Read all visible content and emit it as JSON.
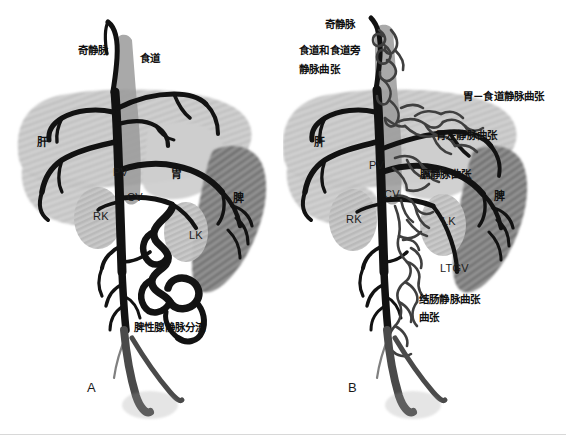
{
  "figure": {
    "title": "",
    "width": 566,
    "height": 435,
    "background": "#ffffff"
  },
  "colors": {
    "vessel_dark": "#111111",
    "vessel_mid": "#3a3a3a",
    "organ_light": "#c9c9c9",
    "organ_hatch_light": "#b4b4b4",
    "organ_dark": "#8a8a8a",
    "organ_hatch_dark": "#6d6d6d",
    "kidney": "#bdbdbd",
    "esophagus": "#9a9a9a",
    "text": "#101010",
    "rule": "#d8d8d8"
  },
  "panels": [
    {
      "id": "A",
      "letter": "A",
      "labels": [
        {
          "name": "azygos-vein",
          "text": "奇静脉",
          "x": 78,
          "y": 44,
          "style": "cn"
        },
        {
          "name": "esophagus",
          "text": "食道",
          "x": 140,
          "y": 52,
          "style": "cn"
        },
        {
          "name": "liver",
          "text": "肝",
          "x": 37,
          "y": 136,
          "style": "organ"
        },
        {
          "name": "portal-vein",
          "text": "PV",
          "x": 113,
          "y": 166,
          "style": "lat"
        },
        {
          "name": "stomach",
          "text": "胃",
          "x": 171,
          "y": 168,
          "style": "organ"
        },
        {
          "name": "spleen",
          "text": "脾",
          "x": 233,
          "y": 192,
          "style": "organ"
        },
        {
          "name": "cava-vein",
          "text": "CV",
          "x": 127,
          "y": 191,
          "style": "lat"
        },
        {
          "name": "right-kidney",
          "text": "RK",
          "x": 93,
          "y": 210,
          "style": "lat"
        },
        {
          "name": "left-kidney",
          "text": "LK",
          "x": 189,
          "y": 229,
          "style": "lat"
        },
        {
          "name": "splenogonadal-shunt",
          "text": "脾性腺静脉分流",
          "x": 134,
          "y": 321,
          "style": "cn"
        }
      ]
    },
    {
      "id": "B",
      "letter": "B",
      "labels": [
        {
          "name": "azygos-vein",
          "text": "奇静脉",
          "x": 42,
          "y": 18,
          "style": "cn"
        },
        {
          "name": "esophageal-paraesophageal-varices-line1",
          "text": "食道和食道旁",
          "x": 16,
          "y": 44,
          "style": "cn"
        },
        {
          "name": "esophageal-paraesophageal-varices-line2",
          "text": "静脉曲张",
          "x": 16,
          "y": 63,
          "style": "cn"
        },
        {
          "name": "gastro-esophageal-varices",
          "text": "胃－食道静脉曲张",
          "x": 180,
          "y": 90,
          "style": "cn"
        },
        {
          "name": "left-gastric-varices",
          "text": "胃左静脉曲张",
          "x": 153,
          "y": 129,
          "style": "cn"
        },
        {
          "name": "liver",
          "text": "肝",
          "x": 31,
          "y": 136,
          "style": "organ"
        },
        {
          "name": "portal-vein",
          "text": "PV",
          "x": 86,
          "y": 159,
          "style": "lat"
        },
        {
          "name": "phrenic-varices",
          "text": "膈静脉曲张",
          "x": 137,
          "y": 168,
          "style": "cn"
        },
        {
          "name": "spleen",
          "text": "脾",
          "x": 211,
          "y": 190,
          "style": "organ"
        },
        {
          "name": "cava-vein",
          "text": "CV",
          "x": 101,
          "y": 188,
          "style": "lat"
        },
        {
          "name": "right-kidney",
          "text": "RK",
          "x": 63,
          "y": 213,
          "style": "lat"
        },
        {
          "name": "left-kidney",
          "text": "LK",
          "x": 159,
          "y": 215,
          "style": "lat"
        },
        {
          "name": "left-testicular-gonadal-vein",
          "text": "LTGV",
          "x": 440,
          "y": 262,
          "style": "lat",
          "absolute": true
        },
        {
          "name": "colonic-varices-line1",
          "text": "结肠静脉曲张",
          "x": 136,
          "y": 293,
          "style": "cn"
        },
        {
          "name": "colonic-varices-line2",
          "text": "曲张",
          "x": 136,
          "y": 311,
          "style": "cn"
        }
      ]
    }
  ]
}
